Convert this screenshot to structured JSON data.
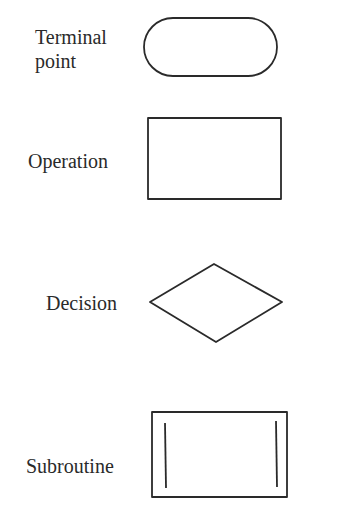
{
  "diagram": {
    "colors": {
      "stroke": "#2a2a2a",
      "text": "#2a2a2a",
      "background": "#ffffff"
    },
    "symbols": [
      {
        "name": "terminal-point",
        "label_lines": [
          "Terminal",
          "point"
        ],
        "shape": "rounded-rectangle"
      },
      {
        "name": "operation",
        "label_lines": [
          "Operation"
        ],
        "shape": "rectangle"
      },
      {
        "name": "decision",
        "label_lines": [
          "Decision"
        ],
        "shape": "diamond"
      },
      {
        "name": "subroutine",
        "label_lines": [
          "Subroutine"
        ],
        "shape": "rectangle-with-inner-vertical-lines"
      }
    ]
  }
}
